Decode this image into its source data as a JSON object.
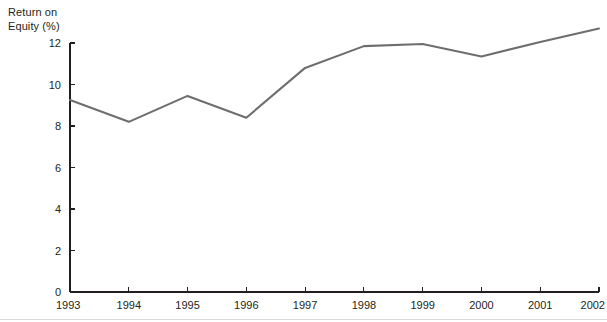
{
  "chart_data": {
    "type": "line",
    "title": "",
    "xlabel": "",
    "ylabel": "Return on\nEquity (%)",
    "x": [
      1993,
      1994,
      1995,
      1996,
      1997,
      1998,
      1999,
      2000,
      2001,
      2002
    ],
    "categories": [
      "1993",
      "1994",
      "1995",
      "1996",
      "1997",
      "1998",
      "1999",
      "2000",
      "2001",
      "2002"
    ],
    "values": [
      9.25,
      8.2,
      9.45,
      8.4,
      10.8,
      11.85,
      11.95,
      11.35,
      12.05,
      12.7
    ],
    "series": [
      {
        "name": "Return on Equity (%)",
        "values": [
          9.25,
          8.2,
          9.45,
          8.4,
          10.8,
          11.85,
          11.95,
          11.35,
          12.05,
          12.7
        ],
        "color": "#6e6e6e"
      }
    ],
    "ylim": [
      0,
      12
    ],
    "yticks": [
      0,
      2,
      4,
      6,
      8,
      10,
      12
    ],
    "ytick_labels": [
      "0",
      "2",
      "4",
      "6",
      "8",
      "10",
      "12"
    ],
    "xtick_labels": [
      "1993",
      "1994",
      "1995",
      "1996",
      "1997",
      "1998",
      "1999",
      "2000",
      "2001",
      "2002"
    ],
    "grid": false,
    "legend": "none",
    "annotations": []
  },
  "axis_title": {
    "line1": "Return on",
    "line2": "Equity (%)"
  },
  "colors": {
    "line": "#6e6e6e",
    "axis": "#231f20",
    "text": "#231f20",
    "background": "#ffffff",
    "footer_rule": "#dadada"
  }
}
